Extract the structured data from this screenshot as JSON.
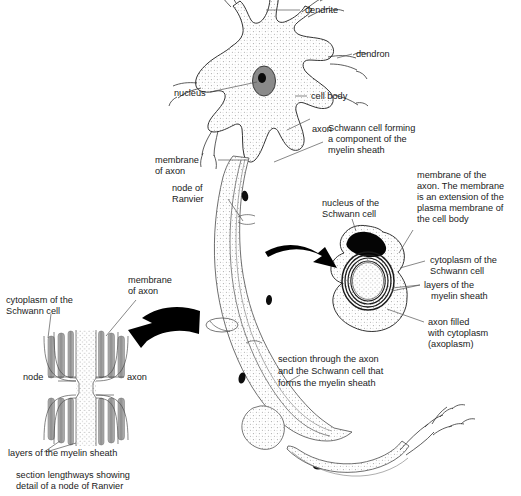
{
  "figure": {
    "background_color": "#ffffff",
    "ink_color": "#1a1a1a",
    "stipple_color": "#9a9a9a",
    "nucleus_gray": "#8a8a8a",
    "nucleus_black": "#000000",
    "myelin_bar_gray": "#9b9b9b",
    "arrow_color": "#000000"
  },
  "labels": {
    "dendrite": "dendrite",
    "dendron": "dendron",
    "nucleus": "nucleus",
    "cell_body": "cell body",
    "axon": "axon",
    "schwann_cell_forming": [
      "Schwann cell forming",
      "a component of the",
      "myelin sheath"
    ],
    "membrane_of_axon_main": [
      "membrane",
      "of axon"
    ],
    "node_of_ranvier": [
      "node of",
      "Ranvier"
    ],
    "nucleus_of_schwann_cell": [
      "nucleus of the",
      "Schwann cell"
    ],
    "membrane_of_the_axon_long": [
      "membrane of the",
      "axon. The membrane",
      "is an extension of the",
      "plasma membrane of",
      "the cell body"
    ],
    "cytoplasm_of_schwann_cell_right": [
      "cytoplasm of the",
      "Schwann cell"
    ],
    "layers_of_myelin_sheath_right": [
      "layers of the",
      "myelin sheath"
    ],
    "axon_filled_axoplasm": [
      "axon filled",
      "with cytoplasm",
      "(axoplasm)"
    ],
    "section_through_axon_caption": [
      "section through the axon",
      "and the Schwann cell that",
      "forms the myelin sheath"
    ],
    "membrane_of_axon_inset": [
      "membrane",
      "of axon"
    ],
    "cytoplasm_of_schwann_cell_left": [
      "cytoplasm of the",
      "Schwann cell"
    ],
    "node": "node",
    "axon_inset": "axon",
    "layers_of_myelin_sheath_left": "layers of the myelin sheath",
    "section_lengthways_caption": [
      "section lengthways showing",
      "detail of a node of Ranvier"
    ]
  },
  "parts": {
    "cell_body_name": "cell body",
    "nucleus_name": "nucleus",
    "dendrites_count": 5,
    "schwann_nuclei_on_axon": 4,
    "myelin_ring_layers": 4,
    "inset_myelin_bars_per_side": 3
  }
}
